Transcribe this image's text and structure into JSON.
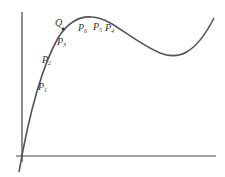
{
  "diagram": {
    "title": "",
    "curve_color": "#555555",
    "axis_color": "#444444",
    "labels": {
      "Q": "Q",
      "P1": "P",
      "P1_sub": "1",
      "P2": "P",
      "P2_sub": "2",
      "P3": "P",
      "P3_sub": "3",
      "P4": "P",
      "P4_sub": "4",
      "P5": "P",
      "P5_sub": "5",
      "P6": "P",
      "P6_sub": "6"
    }
  }
}
